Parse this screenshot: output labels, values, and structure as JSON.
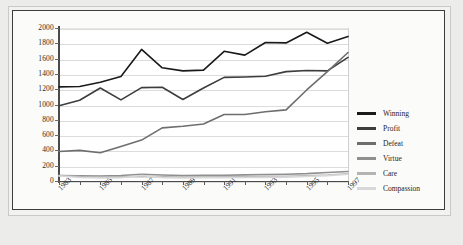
{
  "chart_data": {
    "type": "line",
    "title": "",
    "subtitle": "",
    "xlabel": "",
    "ylabel": "",
    "grid": true,
    "legend_position": "right",
    "xlim": [
      1983,
      1997
    ],
    "ylim": [
      0,
      2000
    ],
    "ytick_labels": [
      "2000",
      "1800",
      "1600",
      "1400",
      "1200",
      "1000",
      "800",
      "600",
      "400",
      "200",
      "0"
    ],
    "ytick_values": [
      2000,
      1800,
      1600,
      1400,
      1200,
      1000,
      800,
      600,
      400,
      200,
      0
    ],
    "x": [
      1983,
      1984,
      1985,
      1986,
      1987,
      1988,
      1989,
      1990,
      1991,
      1992,
      1993,
      1994,
      1995,
      1996,
      1997
    ],
    "xtick_labels": [
      "1983",
      "1985",
      "1987",
      "1989",
      "1991",
      "1993",
      "1995",
      "1997"
    ],
    "xtick_values": [
      1983,
      1985,
      1987,
      1989,
      1991,
      1993,
      1995,
      1997
    ],
    "series": [
      {
        "name": "Winning",
        "color": "#1a1a1a",
        "values": [
          1230,
          1235,
          1290,
          1365,
          1720,
          1480,
          1440,
          1450,
          1695,
          1645,
          1810,
          1805,
          1945,
          1800,
          1890
        ]
      },
      {
        "name": "Profit",
        "color": "#3d3d3d",
        "values": [
          985,
          1055,
          1215,
          1060,
          1220,
          1225,
          1065,
          1215,
          1355,
          1360,
          1370,
          1430,
          1445,
          1440,
          1615
        ]
      },
      {
        "name": "Defeat",
        "color": "#6e6e6e",
        "values": [
          385,
          400,
          370,
          450,
          535,
          695,
          715,
          745,
          870,
          870,
          905,
          930,
          1190,
          1430,
          1680
        ]
      },
      {
        "name": "Virtue",
        "color": "#8f8f8f",
        "values": [
          72,
          68,
          66,
          72,
          88,
          78,
          72,
          74,
          76,
          80,
          84,
          88,
          96,
          112,
          125
        ]
      },
      {
        "name": "Care",
        "color": "#b4b4b4",
        "values": [
          70,
          58,
          52,
          54,
          60,
          54,
          50,
          52,
          54,
          56,
          60,
          62,
          68,
          78,
          95
        ]
      },
      {
        "name": "Compassion",
        "color": "#d8d8d8",
        "values": [
          66,
          46,
          40,
          42,
          72,
          44,
          40,
          42,
          44,
          46,
          48,
          50,
          58,
          70,
          88
        ]
      }
    ]
  },
  "legend": {
    "items": [
      {
        "label": "Winning"
      },
      {
        "label": "Profit"
      },
      {
        "label": "Defeat"
      },
      {
        "label": "Virtue"
      },
      {
        "label": "Care"
      },
      {
        "label": "Compassion"
      }
    ]
  }
}
